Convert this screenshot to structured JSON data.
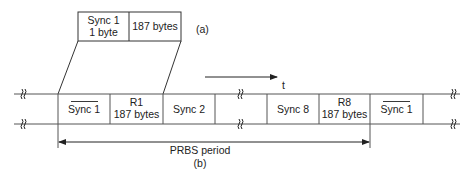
{
  "figure_a": {
    "label": "(a)",
    "cells": [
      {
        "line1": "Sync 1",
        "line2": "1 byte"
      },
      {
        "line1": "187 bytes",
        "line2": ""
      }
    ]
  },
  "time_axis": {
    "label": "t"
  },
  "figure_b": {
    "label": "(b)",
    "cells": [
      {
        "line1": "Sync 1",
        "line2": "",
        "overline": true
      },
      {
        "line1": "R1",
        "line2": "187 bytes",
        "overline": false
      },
      {
        "line1": "Sync 2",
        "line2": "",
        "overline": false
      },
      {
        "line1": "",
        "line2": "",
        "overline": false,
        "gap": true
      },
      {
        "line1": "Sync 8",
        "line2": "",
        "overline": false
      },
      {
        "line1": "R8",
        "line2": "187 bytes",
        "overline": false
      },
      {
        "line1": "Sync 1",
        "line2": "",
        "overline": true
      }
    ],
    "period_label": "PRBS period",
    "break_symbol": "≀≀"
  }
}
